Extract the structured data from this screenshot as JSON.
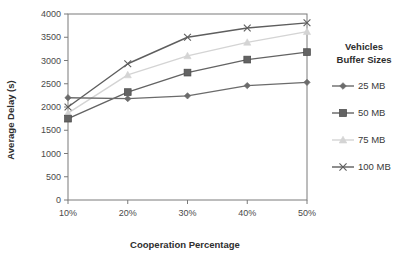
{
  "chart_data": {
    "type": "line",
    "title": "",
    "xlabel": "Cooperation Percentage",
    "ylabel": "Average Delay (s)",
    "categories": [
      "10%",
      "20%",
      "30%",
      "40%",
      "50%"
    ],
    "x_tick_labels": [
      "10%",
      "20%",
      "30%",
      "40%",
      "50%"
    ],
    "y_tick_labels": [
      "0",
      "500",
      "1000",
      "1500",
      "2000",
      "2500",
      "3000",
      "3500",
      "4000"
    ],
    "y_ticks": [
      0,
      500,
      1000,
      1500,
      2000,
      2500,
      3000,
      3500,
      4000
    ],
    "ylim": [
      0,
      4000
    ],
    "grid": false,
    "legend_position": "right",
    "legend_title": "Vehicles Buffer Sizes",
    "legend_title_line1": "Vehicles",
    "legend_title_line2": "Buffer Sizes",
    "series": [
      {
        "name": "25 MB",
        "marker": "diamond",
        "color": "#6b6b6b",
        "values": [
          2200,
          2180,
          2240,
          2460,
          2530
        ]
      },
      {
        "name": "50 MB",
        "marker": "square",
        "color": "#636363",
        "values": [
          1750,
          2320,
          2740,
          3020,
          3180
        ]
      },
      {
        "name": "75 MB",
        "marker": "triangle",
        "color": "#d4d4d4",
        "values": [
          1870,
          2690,
          3100,
          3390,
          3620
        ]
      },
      {
        "name": "100 MB",
        "marker": "x",
        "color": "#5e5e5e",
        "values": [
          2000,
          2930,
          3500,
          3700,
          3810
        ]
      }
    ]
  },
  "legend": {
    "title_line1": "Vehicles",
    "title_line2": "Buffer Sizes",
    "items": [
      {
        "label": "25 MB",
        "marker": "diamond",
        "color": "#6b6b6b"
      },
      {
        "label": "50 MB",
        "marker": "square",
        "color": "#636363"
      },
      {
        "label": "75 MB",
        "marker": "triangle",
        "color": "#d4d4d4"
      },
      {
        "label": "100 MB",
        "marker": "x",
        "color": "#5e5e5e"
      }
    ]
  },
  "axes": {
    "x_title": "Cooperation Percentage",
    "y_title": "Average Delay (s)"
  },
  "colors": {
    "axis": "#7a7a7a",
    "text": "#3a3a3a",
    "background": "#ffffff"
  }
}
